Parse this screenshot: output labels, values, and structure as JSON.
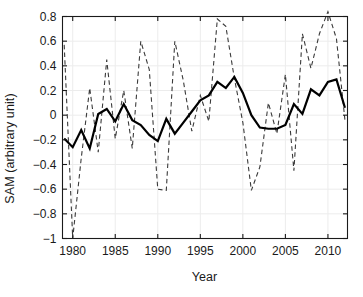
{
  "chart_data": {
    "type": "line",
    "title": "",
    "xlabel": "Year",
    "ylabel": "SAM (arbitrary unit)",
    "xlim": [
      1978.8,
      2012.3
    ],
    "ylim": [
      -1.0,
      0.8
    ],
    "xticks": [
      1980,
      1985,
      1990,
      1995,
      2000,
      2005,
      2010
    ],
    "xtick_labels": [
      "1980",
      "1985",
      "1990",
      "1995",
      "2000",
      "2005",
      "2010"
    ],
    "yticks": [
      -1,
      -0.8,
      -0.6,
      -0.4,
      -0.2,
      0,
      0.2,
      0.4,
      0.6,
      0.8
    ],
    "ytick_labels": [
      "-1",
      "-0.8",
      "-0.6",
      "-0.4",
      "-0.2",
      "0",
      "0.2",
      "0.4",
      "0.6",
      "0.8"
    ],
    "grid": true,
    "legend": "none",
    "x": [
      1979,
      1980,
      1981,
      1982,
      1983,
      1984,
      1985,
      1986,
      1987,
      1988,
      1989,
      1990,
      1991,
      1992,
      1993,
      1994,
      1995,
      1996,
      1997,
      1998,
      1999,
      2000,
      2001,
      2002,
      2003,
      2004,
      2005,
      2006,
      2007,
      2008,
      2009,
      2010,
      2011,
      2012
    ],
    "series": [
      {
        "name": "annual-sam",
        "style": "dashed",
        "color": "#3a3a3a",
        "linewidth": 1.1,
        "values": [
          0.57,
          -1.0,
          -0.35,
          0.22,
          -0.3,
          0.45,
          -0.19,
          0.2,
          -0.27,
          0.6,
          0.37,
          -0.6,
          -0.61,
          0.6,
          0.28,
          -0.13,
          0.16,
          -0.05,
          0.78,
          0.72,
          0.3,
          -0.06,
          -0.61,
          -0.42,
          0.1,
          -0.15,
          0.33,
          -0.45,
          0.66,
          0.38,
          0.66,
          0.84,
          0.62,
          -0.04
        ]
      },
      {
        "name": "smoothed-sam",
        "style": "solid",
        "color": "#000000",
        "linewidth": 2.2,
        "values": [
          -0.19,
          -0.26,
          -0.12,
          -0.27,
          0.01,
          0.05,
          -0.05,
          0.09,
          -0.04,
          -0.08,
          -0.16,
          -0.21,
          -0.03,
          -0.15,
          -0.06,
          0.03,
          0.12,
          0.16,
          0.27,
          0.22,
          0.31,
          0.18,
          0.0,
          -0.1,
          -0.11,
          -0.11,
          -0.08,
          0.09,
          0.01,
          0.21,
          0.16,
          0.27,
          0.29,
          0.06
        ]
      }
    ]
  },
  "axes": {
    "frame_color": "#1a1a1a",
    "grid_color": "#ececec",
    "background": "#ffffff"
  }
}
